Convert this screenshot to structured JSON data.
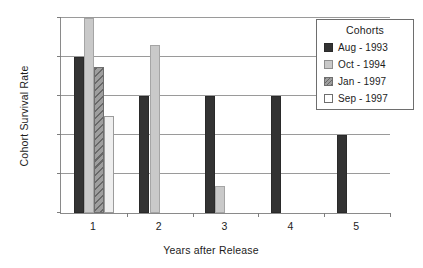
{
  "chart_data": {
    "type": "bar",
    "title": "",
    "xlabel": "Years after Release",
    "ylabel": "Cohort Survival Rate",
    "categories": [
      "1",
      "2",
      "3",
      "4",
      "5"
    ],
    "ylim": [
      0,
      1
    ],
    "yticks": [
      "0",
      "0.2",
      "0.4",
      "0.6",
      "0.8",
      "1"
    ],
    "ytick_values": [
      0,
      0.2,
      0.4,
      0.6,
      0.8,
      1
    ],
    "grid": "horizontal",
    "legend_position": "top-right",
    "legend_title": "Cohorts",
    "series": [
      {
        "name": "Aug - 1993",
        "color": "#333333",
        "pattern": "solid",
        "values": [
          0.8,
          0.6,
          0.6,
          0.6,
          0.4
        ]
      },
      {
        "name": "Oct - 1994",
        "color": "#c9c9c9",
        "pattern": "solid",
        "values": [
          1.0,
          0.86,
          0.14,
          null,
          null
        ]
      },
      {
        "name": "Jan - 1997",
        "color": "#9e9e9e",
        "pattern": "diagonal-hatch",
        "values": [
          0.75,
          null,
          null,
          null,
          null
        ]
      },
      {
        "name": "Sep - 1997",
        "color": "#eeeeee",
        "pattern": "solid",
        "values": [
          0.5,
          null,
          null,
          null,
          null
        ]
      }
    ]
  }
}
